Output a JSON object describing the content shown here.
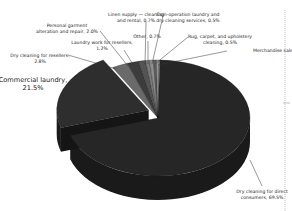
{
  "chart_data": {
    "type": "pie",
    "style": "3d-exploded",
    "title": "",
    "unit": "%",
    "slices": [
      {
        "label_lines": [
          "Dry cleaning for direct",
          "consumers, 69.5%"
        ],
        "name": "Dry cleaning for direct consumers",
        "value": 69.5,
        "color": "#262626"
      },
      {
        "label_lines": [
          "Commercial laundry,",
          "21.5%"
        ],
        "name": "Commercial laundry",
        "value": 21.5,
        "color": "#2e2e2e",
        "exploded": true
      },
      {
        "label_lines": [
          "Dry cleaning for resellers,",
          "2.8%"
        ],
        "name": "Dry cleaning for resellers",
        "value": 2.8,
        "color": "#6a6a6a"
      },
      {
        "label_lines": [
          "Personal garment",
          "alteration and repair, 2.0%"
        ],
        "name": "Personal garment alteration and repair",
        "value": 2.0,
        "color": "#3c3c3c"
      },
      {
        "label_lines": [
          "Laundry work for resellers,",
          "1.2%"
        ],
        "name": "Laundry work for resellers",
        "value": 1.2,
        "color": "#545454"
      },
      {
        "label_lines": [
          "Linen supply — cleaning",
          "and rental, 0.7%"
        ],
        "name": "Linen supply — cleaning and rental",
        "value": 0.7,
        "color": "#7a7a7a"
      },
      {
        "label_lines": [
          "Other, 0.7%"
        ],
        "name": "Other",
        "value": 0.7,
        "color": "#8e8e8e"
      },
      {
        "label_lines": [
          "Coin-operation laundry and",
          "dry cleaning services, 0.5%"
        ],
        "name": "Coin-operation laundry and dry cleaning services",
        "value": 0.5,
        "color": "#5e5e5e"
      },
      {
        "label_lines": [
          "Rug, carpet, and upholstery",
          "cleaning, 0.5%"
        ],
        "name": "Rug, carpet, and upholstery cleaning",
        "value": 0.5,
        "color": "#9a9a9a"
      },
      {
        "label_lines": [
          "Merchandise sales, 0.1%"
        ],
        "name": "Merchandise sales",
        "value": 0.1,
        "color": "#b0b0b0"
      }
    ],
    "legend": "none",
    "side_color": "#1a1a1a"
  }
}
